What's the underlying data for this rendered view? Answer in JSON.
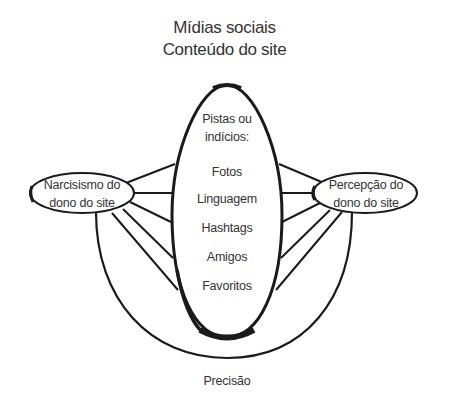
{
  "title": {
    "line1": "Mídias sociais",
    "line2": "Conteúdo do site"
  },
  "center_oval": {
    "heading_line1": "Pistas ou",
    "heading_line2": "indícios:",
    "cues": [
      "Fotos",
      "Linguagem",
      "Hashtags",
      "Amigos",
      "Favoritos"
    ]
  },
  "left_node": {
    "line1": "Narcisismo do",
    "line2": "dono do site"
  },
  "right_node": {
    "line1": "Percepção do",
    "line2": "dono do site"
  },
  "bottom_label": "Precisão",
  "colors": {
    "stroke": "#1a1a1a",
    "text": "#333333",
    "background": "#ffffff"
  }
}
